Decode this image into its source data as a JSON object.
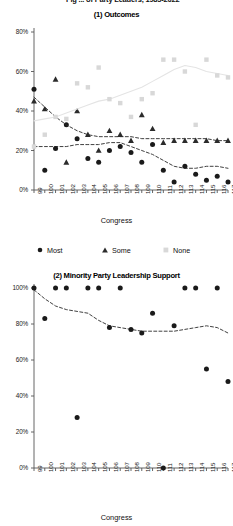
{
  "figure": {
    "header_clipped": "Fig ... of Party Leaders, 1985-2022",
    "axis_title": "Congress"
  },
  "legend": {
    "items": [
      {
        "label": "Most",
        "marker": "circle",
        "color": "#1a1a1a"
      },
      {
        "label": "Some",
        "marker": "triangle",
        "color": "#2b2b2b"
      },
      {
        "label": "None",
        "marker": "square",
        "color": "#d8d8d8"
      }
    ]
  },
  "chart_data": [
    {
      "type": "scatter",
      "title": "(1) Outcomes",
      "xlabel": "Congress",
      "ylabel": "",
      "grid": false,
      "legend_position": "bottom",
      "xlim": [
        99,
        117
      ],
      "ylim": [
        0,
        80
      ],
      "yticks": [
        0,
        20,
        40,
        60,
        80
      ],
      "ytick_labels": [
        "0%",
        "20%",
        "40%",
        "60%",
        "80%"
      ],
      "categories": [
        99,
        100,
        101,
        102,
        103,
        104,
        105,
        106,
        107,
        108,
        109,
        110,
        111,
        112,
        113,
        114,
        115,
        116,
        117
      ],
      "xtick_labels": [
        "99",
        "100",
        "101",
        "102",
        "103",
        "104",
        "105",
        "106",
        "107",
        "108",
        "109",
        "110",
        "111",
        "112",
        "113",
        "114",
        "115",
        "116",
        "117"
      ],
      "series": [
        {
          "name": "Most",
          "marker": "circle",
          "color": "#1a1a1a",
          "values": [
            51,
            10,
            21,
            33,
            26,
            16,
            14,
            20,
            22,
            19,
            14,
            23,
            10,
            4,
            12,
            8,
            5,
            7,
            4
          ],
          "trend": [
            22,
            22,
            22,
            22,
            23,
            23,
            23,
            24,
            24,
            22,
            20,
            18,
            15,
            12,
            11,
            11,
            12,
            12,
            11
          ]
        },
        {
          "name": "Some",
          "marker": "triangle",
          "color": "#2b2b2b",
          "values": [
            45,
            41,
            56,
            14,
            40,
            28,
            20,
            30,
            28,
            25,
            38,
            31,
            24,
            25,
            25,
            25,
            25,
            25,
            25
          ],
          "trend": [
            47,
            42,
            37,
            33,
            30,
            28,
            27,
            27,
            27,
            27,
            26,
            26,
            26,
            26,
            26,
            26,
            26,
            25,
            25
          ]
        },
        {
          "name": "None",
          "marker": "square",
          "color": "#d8d8d8",
          "values": [
            22,
            28,
            37,
            36,
            54,
            52,
            62,
            46,
            44,
            37,
            46,
            49,
            66,
            66,
            60,
            33,
            66,
            58,
            57
          ],
          "trend": [
            35,
            36,
            37,
            39,
            41,
            43,
            45,
            46,
            48,
            50,
            52,
            55,
            58,
            61,
            63,
            62,
            60,
            59,
            58
          ]
        }
      ]
    },
    {
      "type": "scatter",
      "title": "(2) Minority Party Leadership Support",
      "xlabel": "Congress",
      "ylabel": "",
      "grid": false,
      "legend_position": "none",
      "xlim": [
        99,
        117
      ],
      "ylim": [
        0,
        100
      ],
      "yticks": [
        0,
        20,
        40,
        60,
        80,
        100
      ],
      "ytick_labels": [
        "0%",
        "20%",
        "40%",
        "60%",
        "80%",
        "100%"
      ],
      "categories": [
        99,
        100,
        101,
        102,
        103,
        104,
        105,
        106,
        107,
        108,
        109,
        110,
        111,
        112,
        113,
        114,
        115,
        116,
        117
      ],
      "xtick_labels": [
        "99",
        "100",
        "101",
        "102",
        "103",
        "104",
        "105",
        "106",
        "107",
        "108",
        "109",
        "110",
        "111",
        "112",
        "113",
        "114",
        "115",
        "116",
        "117"
      ],
      "series": [
        {
          "name": "Minority Party Leadership Support",
          "marker": "circle",
          "color": "#1a1a1a",
          "values": [
            100,
            83,
            100,
            100,
            28,
            100,
            100,
            78,
            100,
            77,
            75,
            86,
            0,
            79,
            100,
            100,
            55,
            100,
            48
          ],
          "trend": [
            99,
            94,
            90,
            88,
            87,
            86,
            82,
            79,
            78,
            77,
            76,
            76,
            76,
            76,
            77,
            78,
            79,
            78,
            75
          ]
        }
      ]
    }
  ]
}
